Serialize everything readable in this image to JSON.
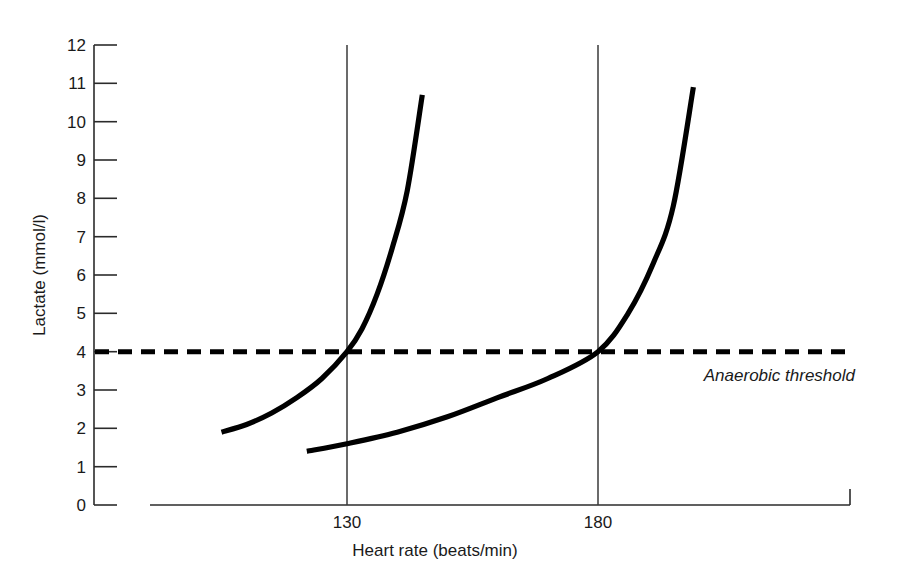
{
  "chart_data": {
    "type": "line",
    "title": "",
    "subtitle": "",
    "xlabel": "Heart rate (beats/min)",
    "ylabel": "Lactate (mmol/l)",
    "xlim": [
      100,
      205
    ],
    "ylim": [
      0,
      12
    ],
    "grid": false,
    "legend": "none",
    "x_ticks": [
      130,
      180
    ],
    "x_tick_labels": [
      "130",
      "180"
    ],
    "y_ticks": [
      0,
      1,
      2,
      3,
      4,
      5,
      6,
      7,
      8,
      9,
      10,
      11,
      12
    ],
    "y_tick_labels": [
      "0",
      "1",
      "2",
      "3",
      "4",
      "5",
      "6",
      "7",
      "8",
      "9",
      "10",
      "11",
      "12"
    ],
    "annotations": [
      {
        "name": "anaerobic-threshold-label",
        "text": "Anaerobic threshold",
        "x": 185,
        "y": 3.45,
        "style": "italic"
      }
    ],
    "reference_lines": [
      {
        "name": "anaerobic-threshold",
        "orientation": "horizontal",
        "value": 4,
        "style": "dashed",
        "label": "Anaerobic threshold"
      },
      {
        "name": "heart-rate-130",
        "orientation": "vertical",
        "value": 130,
        "style": "solid",
        "label": "130"
      },
      {
        "name": "heart-rate-180",
        "orientation": "vertical",
        "value": 180,
        "style": "solid",
        "label": "180"
      }
    ],
    "series": [
      {
        "name": "Untrained lactate curve",
        "style": "solid",
        "color": "#000000",
        "threshold_heart_rate": 130,
        "points": [
          {
            "x": 105,
            "y": 1.9
          },
          {
            "x": 110,
            "y": 2.1
          },
          {
            "x": 115,
            "y": 2.4
          },
          {
            "x": 120,
            "y": 2.8
          },
          {
            "x": 125,
            "y": 3.3
          },
          {
            "x": 130,
            "y": 4.0
          },
          {
            "x": 133,
            "y": 4.6
          },
          {
            "x": 136,
            "y": 5.5
          },
          {
            "x": 139,
            "y": 6.7
          },
          {
            "x": 142,
            "y": 8.2
          },
          {
            "x": 145,
            "y": 10.7
          }
        ]
      },
      {
        "name": "Trained lactate curve",
        "style": "solid",
        "color": "#000000",
        "threshold_heart_rate": 180,
        "points": [
          {
            "x": 122,
            "y": 1.4
          },
          {
            "x": 130,
            "y": 1.6
          },
          {
            "x": 140,
            "y": 1.9
          },
          {
            "x": 150,
            "y": 2.3
          },
          {
            "x": 160,
            "y": 2.8
          },
          {
            "x": 170,
            "y": 3.3
          },
          {
            "x": 180,
            "y": 4.0
          },
          {
            "x": 186,
            "y": 5.0
          },
          {
            "x": 191,
            "y": 6.3
          },
          {
            "x": 195,
            "y": 7.8
          },
          {
            "x": 199,
            "y": 10.9
          }
        ]
      }
    ]
  }
}
